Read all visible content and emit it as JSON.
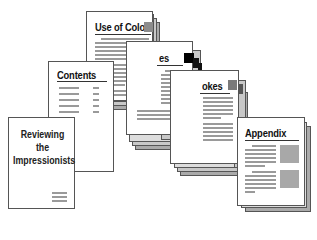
{
  "diagram": {
    "cover": {
      "title_lines": [
        "Reviewing",
        "the",
        "Impressionists"
      ]
    },
    "contents": {
      "title": "Contents"
    },
    "sections": [
      {
        "title": "Use of Color",
        "visible_title": "Use of Color",
        "tab_color": "#8c8c8c"
      },
      {
        "title": "...es",
        "visible_title": "es",
        "tab_color": "#000000"
      },
      {
        "title": "...okes",
        "visible_title": "okes",
        "tab_color": "#7a7a7a"
      }
    ],
    "appendix": {
      "title": "Appendix"
    }
  }
}
